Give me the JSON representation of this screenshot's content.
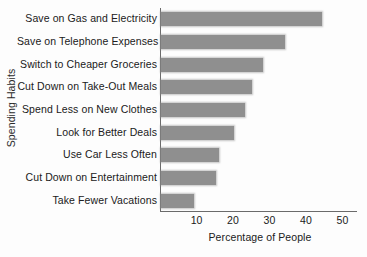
{
  "chart_data": {
    "type": "bar",
    "orientation": "horizontal",
    "title": "",
    "xlabel": "Percentage of People",
    "ylabel": "Spending Habits",
    "categories": [
      "Save on Gas and Electricity",
      "Save on Telephone Expenses",
      "Switch to Cheaper Groceries",
      "Cut Down on Take-Out Meals",
      "Spend Less on New Clothes",
      "Look for Better Deals",
      "Use Car Less Often",
      "Cut Down on Entertainment",
      "Take Fewer Vacations"
    ],
    "values": [
      44,
      34,
      28,
      25,
      23,
      20,
      16,
      15,
      9
    ],
    "xticks": [
      10,
      20,
      30,
      40,
      50
    ],
    "xlim": [
      0,
      54
    ],
    "grid": false,
    "legend": false,
    "bar_color": "#8f8f8f",
    "axis_color": "#6b6b6b",
    "background_color": "#fdfdfd"
  }
}
